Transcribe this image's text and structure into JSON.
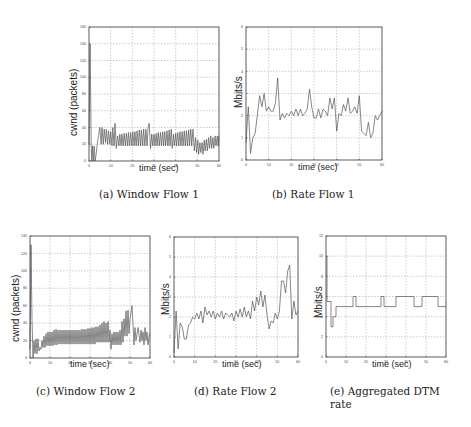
{
  "figure": {
    "panels": [
      {
        "id": "a",
        "caption": "(a) Window Flow 1"
      },
      {
        "id": "b",
        "caption": "(b) Rate Flow 1"
      },
      {
        "id": "c",
        "caption": "(c) Window Flow 2"
      },
      {
        "id": "d",
        "caption": "(d) Rate Flow 2"
      },
      {
        "id": "e",
        "caption": "(e) Aggregated DTM rate"
      }
    ]
  },
  "chart_data": [
    {
      "id": "a",
      "type": "line",
      "title": "Window Flow 1",
      "xlabel": "time (sec)",
      "ylabel": "cwnd (packets)",
      "xlim": [
        0,
        60
      ],
      "ylim": [
        0,
        160
      ],
      "xticks": [
        0,
        10,
        20,
        30,
        40,
        50,
        60
      ],
      "yticks": [
        0,
        20,
        40,
        60,
        80,
        100,
        120,
        140,
        160
      ],
      "grid": true,
      "series": [
        {
          "name": "cwnd",
          "color": "#555555",
          "x": [
            0,
            0.5,
            1.0,
            1.3,
            1.6,
            2.0,
            2.4,
            2.8,
            3.4,
            3.8,
            4.4,
            5.0,
            5.6,
            6.0,
            6.6,
            7.0,
            7.6,
            8.0,
            8.6,
            9.0,
            9.6,
            10.0,
            10.6,
            11.0,
            11.6,
            12.0,
            12.6,
            13.2,
            13.8,
            14.2,
            14.8,
            15.2,
            15.8,
            16.2,
            16.8,
            17.2,
            17.8,
            18.2,
            18.8,
            19.2,
            19.8,
            20.2,
            20.8,
            21.2,
            21.8,
            22.2,
            22.8,
            23.2,
            23.8,
            24.2,
            24.8,
            25.2,
            25.8,
            26.2,
            26.8,
            27.2,
            27.8,
            28.4,
            29.0,
            29.4,
            30.0,
            30.4,
            31.0,
            31.4,
            32.0,
            32.4,
            33.0,
            33.4,
            34.0,
            34.4,
            35.0,
            35.4,
            36.0,
            36.4,
            37.0,
            37.4,
            38.0,
            38.4,
            39.0,
            39.4,
            40.0,
            40.4,
            41.0,
            41.4,
            42.0,
            42.4,
            43.0,
            43.4,
            44.0,
            44.4,
            45.0,
            45.4,
            46.0,
            46.4,
            47.0,
            47.4,
            48.0,
            48.6,
            49.2,
            49.6,
            50.2,
            50.6,
            51.2,
            51.6,
            52.2,
            52.6,
            53.2,
            53.6,
            54.2,
            54.6,
            55.2,
            55.6,
            56.2,
            56.6,
            57.2,
            57.6,
            58.2,
            58.6,
            59.2,
            59.6,
            60.0
          ],
          "y": [
            20,
            140,
            20,
            0,
            18,
            0,
            18,
            0,
            10,
            20,
            30,
            40,
            20,
            40,
            20,
            38,
            22,
            38,
            20,
            36,
            20,
            35,
            18,
            40,
            18,
            45,
            15,
            30,
            18,
            32,
            18,
            32,
            18,
            33,
            18,
            33,
            18,
            34,
            18,
            34,
            18,
            35,
            18,
            35,
            18,
            36,
            18,
            37,
            18,
            37,
            18,
            38,
            18,
            38,
            18,
            38,
            45,
            15,
            32,
            18,
            32,
            18,
            33,
            18,
            34,
            18,
            34,
            18,
            35,
            18,
            35,
            18,
            36,
            18,
            37,
            18,
            38,
            15,
            32,
            18,
            33,
            18,
            34,
            18,
            35,
            18,
            35,
            18,
            36,
            18,
            36,
            18,
            37,
            18,
            38,
            18,
            38,
            12,
            28,
            10,
            25,
            8,
            22,
            10,
            22,
            8,
            25,
            12,
            26,
            12,
            28,
            15,
            30,
            15,
            28,
            15,
            30,
            18,
            30,
            18,
            30
          ]
        }
      ]
    },
    {
      "id": "b",
      "type": "line",
      "title": "Rate Flow 1",
      "xlabel": "time (sec)",
      "ylabel": "Mbits/s",
      "xlim": [
        0,
        60
      ],
      "ylim": [
        0,
        6
      ],
      "xticks": [
        0,
        10,
        20,
        30,
        40,
        50,
        60
      ],
      "yticks": [
        0,
        1,
        2,
        3,
        4,
        5,
        6
      ],
      "grid": true,
      "series": [
        {
          "name": "rate",
          "color": "#555555",
          "x": [
            0,
            1,
            2,
            3,
            4,
            5,
            6,
            7,
            8,
            9,
            10,
            11,
            12,
            13,
            14,
            15,
            16,
            17,
            18,
            19,
            20,
            21,
            22,
            23,
            24,
            25,
            26,
            27,
            28,
            29,
            30,
            31,
            32,
            33,
            34,
            35,
            36,
            37,
            38,
            39,
            40,
            41,
            42,
            43,
            44,
            45,
            46,
            47,
            48,
            49,
            50,
            51,
            52,
            53,
            54,
            55,
            56,
            57,
            58,
            59,
            60
          ],
          "y": [
            0.8,
            2.4,
            0.3,
            1.0,
            1.2,
            2.0,
            2.9,
            2.4,
            3.0,
            2.2,
            2.4,
            2.2,
            2.2,
            2.6,
            3.7,
            1.8,
            2.1,
            1.9,
            2.1,
            2.0,
            2.2,
            2.0,
            2.3,
            2.0,
            2.3,
            2.0,
            2.1,
            2.3,
            3.2,
            2.4,
            1.9,
            1.9,
            2.3,
            1.9,
            2.3,
            2.2,
            2.0,
            2.8,
            2.3,
            2.8,
            1.3,
            2.1,
            2.0,
            2.5,
            2.2,
            2.8,
            2.1,
            2.2,
            2.4,
            2.1,
            2.9,
            1.3,
            1.2,
            1.1,
            1.7,
            1.0,
            1.2,
            2.0,
            1.8,
            2.0,
            2.2
          ]
        }
      ]
    },
    {
      "id": "c",
      "type": "line",
      "title": "Window Flow 2",
      "xlabel": "time (sec)",
      "ylabel": "cwnd (packets)",
      "xlim": [
        0,
        60
      ],
      "ylim": [
        0,
        140
      ],
      "xticks": [
        0,
        10,
        20,
        30,
        40,
        50,
        60
      ],
      "yticks": [
        0,
        20,
        40,
        60,
        80,
        100,
        120,
        140
      ],
      "grid": true,
      "series": [
        {
          "name": "cwnd",
          "color": "#555555",
          "x": [
            0,
            0.5,
            1.0,
            1.5,
            2.0,
            2.5,
            3.0,
            3.5,
            4.0,
            4.5,
            5.0,
            5.5,
            6.0,
            6.5,
            7.0,
            7.5,
            8.0,
            8.5,
            9.0,
            9.5,
            10.0,
            10.5,
            11.0,
            11.5,
            12.0,
            12.5,
            13.0,
            13.5,
            14.0,
            14.5,
            15.0,
            15.5,
            16.0,
            16.5,
            17.0,
            17.5,
            18.0,
            18.5,
            19.0,
            19.5,
            20.0,
            20.5,
            21.0,
            21.5,
            22.0,
            22.5,
            23.0,
            23.5,
            24.0,
            24.5,
            25.0,
            25.5,
            26.0,
            26.5,
            27.0,
            27.5,
            28.0,
            28.5,
            29.0,
            29.5,
            30.0,
            30.5,
            31.0,
            31.5,
            32.0,
            32.5,
            33.0,
            33.5,
            34.0,
            34.5,
            35.0,
            35.5,
            36.0,
            36.5,
            37.0,
            37.5,
            38.0,
            38.5,
            39.0,
            39.5,
            40.0,
            40.5,
            41.0,
            41.5,
            42.0,
            42.5,
            43.0,
            43.5,
            44.0,
            44.5,
            45.0,
            45.5,
            46.0,
            46.5,
            47.0,
            47.5,
            48.0,
            48.5,
            49.0,
            49.5,
            50.0,
            51.0,
            52.0,
            52.5,
            53.0,
            54.0,
            55.0,
            55.5,
            56.0,
            56.5,
            57.0,
            57.5,
            58.0,
            58.5,
            59.0,
            59.5,
            60.0
          ],
          "y": [
            10,
            130,
            45,
            0,
            20,
            5,
            22,
            5,
            22,
            8,
            12,
            10,
            20,
            12,
            25,
            12,
            28,
            14,
            30,
            14,
            30,
            14,
            30,
            14,
            32,
            15,
            33,
            15,
            32,
            16,
            32,
            16,
            32,
            16,
            32,
            16,
            32,
            16,
            32,
            16,
            32,
            16,
            32,
            16,
            32,
            16,
            32,
            16,
            32,
            16,
            32,
            16,
            33,
            16,
            33,
            16,
            33,
            16,
            34,
            16,
            34,
            16,
            35,
            16,
            35,
            16,
            36,
            18,
            36,
            18,
            38,
            18,
            40,
            18,
            42,
            18,
            40,
            18,
            42,
            18,
            32,
            10,
            28,
            15,
            30,
            15,
            30,
            15,
            30,
            15,
            32,
            15,
            42,
            18,
            45,
            25,
            54,
            25,
            55,
            28,
            45,
            60,
            15,
            35,
            20,
            35,
            18,
            32,
            20,
            30,
            15,
            35,
            20,
            30,
            15,
            25,
            28
          ]
        }
      ]
    },
    {
      "id": "d",
      "type": "line",
      "title": "Rate Flow 2",
      "xlabel": "time (sec)",
      "ylabel": "Mbits/s",
      "xlim": [
        0,
        60
      ],
      "ylim": [
        0,
        6
      ],
      "xticks": [
        0,
        10,
        20,
        30,
        40,
        50,
        60
      ],
      "yticks": [
        0,
        1,
        2,
        3,
        4,
        5,
        6
      ],
      "grid": true,
      "series": [
        {
          "name": "rate",
          "color": "#555555",
          "x": [
            0,
            1,
            2,
            3,
            4,
            5,
            6,
            7,
            8,
            9,
            10,
            11,
            12,
            13,
            14,
            15,
            16,
            17,
            18,
            19,
            20,
            21,
            22,
            23,
            24,
            25,
            26,
            27,
            28,
            29,
            30,
            31,
            32,
            33,
            34,
            35,
            36,
            37,
            38,
            39,
            40,
            41,
            42,
            43,
            44,
            45,
            46,
            47,
            48,
            49,
            50,
            51,
            52,
            53,
            54,
            55,
            56,
            57,
            58,
            59,
            60
          ],
          "y": [
            0.2,
            2.3,
            0.4,
            1.7,
            1.5,
            0.9,
            0.9,
            1.6,
            1.7,
            2.0,
            1.9,
            2.2,
            1.9,
            2.3,
            1.7,
            2.5,
            2.1,
            2.3,
            2.0,
            2.3,
            1.9,
            2.2,
            2.0,
            2.3,
            1.9,
            2.2,
            2.1,
            2.0,
            2.2,
            1.8,
            2.3,
            2.0,
            2.4,
            2.0,
            2.5,
            2.0,
            2.3,
            1.9,
            2.8,
            2.3,
            3.0,
            2.6,
            3.3,
            2.5,
            3.1,
            2.1,
            1.4,
            1.8,
            1.7,
            2.2,
            1.9,
            2.3,
            3.8,
            3.8,
            3.2,
            4.3,
            4.6,
            1.9,
            2.8,
            2.1,
            2.3
          ]
        }
      ]
    },
    {
      "id": "e",
      "type": "line",
      "title": "Aggregated DTM rate",
      "xlabel": "time (sec)",
      "ylabel": "Mbits/s",
      "xlim": [
        0,
        60
      ],
      "ylim": [
        0,
        12
      ],
      "xticks": [
        0,
        10,
        20,
        30,
        40,
        50,
        60
      ],
      "yticks": [
        0,
        2,
        4,
        6,
        8,
        10,
        12
      ],
      "grid": true,
      "series": [
        {
          "name": "aggregated rate",
          "color": "#555555",
          "step": true,
          "x": [
            0,
            0.5,
            0.5,
            2.5,
            2.5,
            3.5,
            3.5,
            5.0,
            5.0,
            13.5,
            13.5,
            15.0,
            15.0,
            27.5,
            27.5,
            29.0,
            29.0,
            35.0,
            35.0,
            44.0,
            44.0,
            48.0,
            48.0,
            56.0,
            56.0,
            60.0
          ],
          "y": [
            10,
            10,
            5.5,
            5.5,
            3,
            3,
            4,
            4,
            5,
            5,
            6,
            6,
            5,
            5,
            6,
            6,
            5,
            5,
            6,
            6,
            5,
            5,
            6,
            6,
            5,
            5
          ]
        }
      ]
    }
  ]
}
